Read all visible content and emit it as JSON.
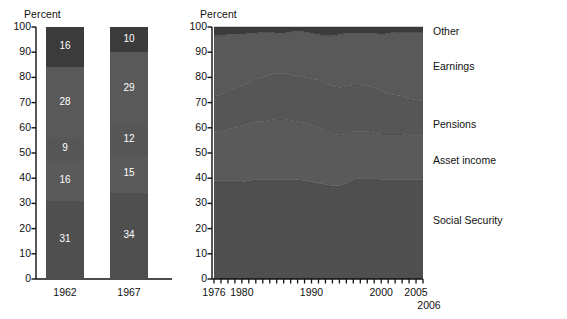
{
  "chart_data": [
    {
      "type": "bar",
      "id": "stacked-bars-1962-1967",
      "title": "",
      "ylabel": "Percent",
      "xlabel": "",
      "ylim": [
        0,
        100
      ],
      "yticks": [
        0,
        10,
        20,
        30,
        40,
        50,
        60,
        70,
        80,
        90,
        100
      ],
      "categories": [
        "1962",
        "1967"
      ],
      "stack_order_bottom_up": [
        "Social Security",
        "Asset income",
        "Pensions",
        "Earnings",
        "Other"
      ],
      "series": [
        {
          "name": "Social Security",
          "values": [
            31,
            34
          ],
          "color": "#4f4f4f"
        },
        {
          "name": "Asset income",
          "values": [
            16,
            15
          ],
          "color": "#5a5a5a"
        },
        {
          "name": "Pensions",
          "values": [
            9,
            12
          ],
          "color": "#565656"
        },
        {
          "name": "Earnings",
          "values": [
            28,
            29
          ],
          "color": "#595959"
        },
        {
          "name": "Other",
          "values": [
            16,
            10
          ],
          "color": "#3b3b3b"
        }
      ],
      "bar_labels": {
        "1962": [
          "31",
          "16",
          "9",
          "28",
          "16"
        ],
        "1967": [
          "34",
          "15",
          "12",
          "29",
          "10"
        ]
      },
      "grid": false,
      "legend_position": "none"
    },
    {
      "type": "area",
      "id": "stacked-area-1976-2006",
      "title": "",
      "ylabel": "Percent",
      "xlabel": "",
      "ylim": [
        0,
        100
      ],
      "yticks": [
        0,
        10,
        20,
        30,
        40,
        50,
        60,
        70,
        80,
        90,
        100
      ],
      "xlim": [
        1976,
        2006
      ],
      "xticks": [
        1976,
        1977,
        1978,
        1979,
        1980,
        1981,
        1982,
        1983,
        1984,
        1985,
        1986,
        1987,
        1988,
        1989,
        1990,
        1991,
        1992,
        1993,
        1994,
        1995,
        1996,
        1997,
        1998,
        1999,
        2000,
        2001,
        2002,
        2003,
        2004,
        2005,
        2006
      ],
      "xtick_labels": [
        "1976",
        "1980",
        "1990",
        "2000",
        "2005",
        "2006"
      ],
      "xtick_label_years": [
        1976,
        1980,
        1990,
        2000,
        2005,
        2006
      ],
      "x": [
        1976,
        1977,
        1978,
        1979,
        1980,
        1981,
        1982,
        1983,
        1984,
        1985,
        1986,
        1987,
        1988,
        1989,
        1990,
        1991,
        1992,
        1993,
        1994,
        1995,
        1996,
        1997,
        1998,
        1999,
        2000,
        2001,
        2002,
        2003,
        2004,
        2005,
        2006
      ],
      "stack_order_bottom_up": [
        "Social Security",
        "Asset income",
        "Pensions",
        "Earnings",
        "Other"
      ],
      "series": [
        {
          "name": "Social Security",
          "color": "#4f4f4f",
          "values": [
            38.5,
            38.5,
            38.5,
            38.5,
            38.5,
            39,
            39.5,
            39.5,
            39.5,
            39.5,
            39.5,
            39.5,
            39.5,
            39,
            38.5,
            38,
            37.5,
            37,
            37,
            38,
            39.5,
            40,
            40,
            40,
            39.5,
            39.5,
            39.5,
            39.5,
            39.5,
            39.5,
            39.5
          ]
        },
        {
          "name": "Asset income",
          "color": "#5a5a5a",
          "values": [
            19.5,
            20,
            21,
            21.5,
            22,
            22.5,
            23,
            23,
            23.5,
            24,
            24,
            23.5,
            23,
            23,
            22.5,
            22,
            21,
            20.5,
            20,
            19.5,
            19,
            18.5,
            18.5,
            18,
            18,
            18,
            18,
            18,
            17.5,
            17.5,
            17.5
          ]
        },
        {
          "name": "Pensions",
          "color": "#565656",
          "values": [
            14.5,
            14.5,
            15,
            15.5,
            16,
            16.5,
            17,
            17.5,
            18,
            18,
            18,
            18,
            18,
            18,
            18.5,
            19,
            19,
            19,
            19,
            19,
            18.5,
            18.5,
            18,
            18,
            17,
            16,
            15.5,
            15,
            14.5,
            14,
            13.5
          ]
        },
        {
          "name": "Earnings",
          "color": "#595959",
          "values": [
            24,
            23.5,
            22.5,
            21.5,
            20.5,
            19.5,
            18,
            18,
            17,
            16,
            16,
            17,
            18,
            18,
            18,
            18,
            19,
            20,
            21,
            21,
            20.5,
            20.5,
            21,
            21.5,
            22.5,
            24,
            25,
            25.5,
            26.5,
            27,
            27.5
          ]
        },
        {
          "name": "Other",
          "color": "#3b3b3b",
          "values": [
            3.5,
            3.5,
            3,
            3,
            3,
            2.5,
            2.5,
            2,
            2,
            2.5,
            2.5,
            2,
            1.5,
            2,
            2.5,
            3,
            3.5,
            3.5,
            3,
            2.5,
            2.5,
            2.5,
            2.5,
            2.5,
            3,
            2.5,
            2,
            2,
            2,
            2,
            2
          ]
        }
      ],
      "legend_position": "right",
      "legend_entries": [
        {
          "label": "Other",
          "y_percent": 98
        },
        {
          "label": "Earnings",
          "y_percent": 84
        },
        {
          "label": "Pensions",
          "y_percent": 61
        },
        {
          "label": "Asset income",
          "y_percent": 47
        },
        {
          "label": "Social Security",
          "y_percent": 23
        }
      ],
      "grid": false
    }
  ],
  "bars_panel": {
    "axis_title": "Percent",
    "yticks": [
      "100",
      "90",
      "80",
      "70",
      "60",
      "50",
      "40",
      "30",
      "20",
      "10",
      "0"
    ],
    "bars": [
      {
        "category": "1962",
        "segments": [
          {
            "label": "16",
            "value": 16,
            "color": "#3b3b3b"
          },
          {
            "label": "28",
            "value": 28,
            "color": "#595959"
          },
          {
            "label": "9",
            "value": 9,
            "color": "#565656"
          },
          {
            "label": "16",
            "value": 16,
            "color": "#5a5a5a"
          },
          {
            "label": "31",
            "value": 31,
            "color": "#4f4f4f"
          }
        ]
      },
      {
        "category": "1967",
        "segments": [
          {
            "label": "10",
            "value": 10,
            "color": "#3b3b3b"
          },
          {
            "label": "29",
            "value": 29,
            "color": "#595959"
          },
          {
            "label": "12",
            "value": 12,
            "color": "#565656"
          },
          {
            "label": "15",
            "value": 15,
            "color": "#5a5a5a"
          },
          {
            "label": "34",
            "value": 34,
            "color": "#4f4f4f"
          }
        ]
      }
    ]
  },
  "area_panel": {
    "axis_title": "Percent",
    "yticks": [
      "100",
      "90",
      "80",
      "70",
      "60",
      "50",
      "40",
      "30",
      "20",
      "10",
      "0"
    ],
    "xticks": [
      "1976",
      "1980",
      "1990",
      "2000",
      "2005"
    ],
    "xtick_extra": "2006",
    "legend": [
      "Other",
      "Earnings",
      "Pensions",
      "Asset income",
      "Social Security"
    ]
  },
  "colors": {
    "social_security": "#4f4f4f",
    "asset_income": "#5a5a5a",
    "pensions": "#565656",
    "earnings": "#595959",
    "other": "#3b3b3b",
    "axis": "#111111",
    "background": "#ffffff"
  }
}
